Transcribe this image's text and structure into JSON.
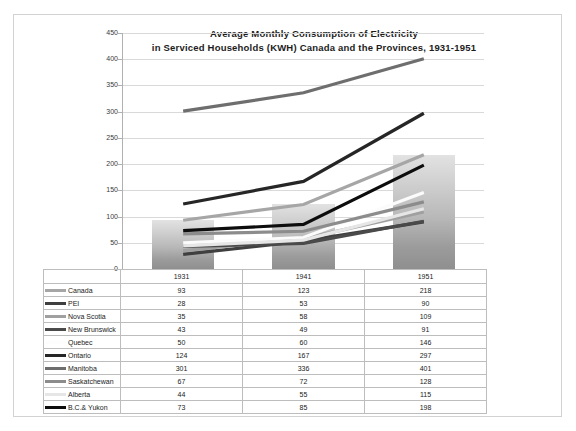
{
  "chart_data": {
    "type": "line",
    "title": "Average Monthly Consumption  of Electricity",
    "subtitle": "in Serviced Households  (KWH) Canada  and the Provinces, 1931-1951",
    "xlabel": "",
    "ylabel": "",
    "categories": [
      "1931",
      "1941",
      "1951"
    ],
    "ylim": [
      0,
      450
    ],
    "ytick_step": 50,
    "yticks": [
      "450",
      "400",
      "350",
      "300",
      "250",
      "200",
      "150",
      "100",
      "50",
      "0"
    ],
    "grid": true,
    "legend": "table-left-column",
    "background_bars": {
      "name": "Canada",
      "values": [
        93,
        123,
        218
      ],
      "note": "grey gradient column bars behind the lines"
    },
    "series": [
      {
        "name": "Canada",
        "values": [
          93,
          123,
          218
        ],
        "color": "#a6a6a6"
      },
      {
        "name": "PEI",
        "values": [
          28,
          53,
          90
        ],
        "color": "#3f3f3f"
      },
      {
        "name": "Nova Scotia",
        "values": [
          35,
          58,
          109
        ],
        "color": "#a0a0a0"
      },
      {
        "name": "New Brunswick",
        "values": [
          43,
          49,
          91
        ],
        "color": "#4a4a4a"
      },
      {
        "name": "Quebec",
        "values": [
          50,
          60,
          146
        ],
        "color": "#fbfbfb"
      },
      {
        "name": "Ontario",
        "values": [
          124,
          167,
          297
        ],
        "color": "#262626"
      },
      {
        "name": "Manitoba",
        "values": [
          301,
          336,
          401
        ],
        "color": "#6e6e6e"
      },
      {
        "name": "Saskatchewan",
        "values": [
          67,
          72,
          128
        ],
        "color": "#8c8c8c"
      },
      {
        "name": "Alberta",
        "values": [
          44,
          55,
          115
        ],
        "color": "#e6e6e6"
      },
      {
        "name": "B.C.& Yukon",
        "values": [
          73,
          85,
          198
        ],
        "color": "#0d0d0d"
      }
    ]
  },
  "table": {
    "header": [
      "",
      "1931",
      "1941",
      "1951"
    ],
    "rows": [
      {
        "label": "Canada",
        "swatch": "#a6a6a6",
        "v1931": "93",
        "v1941": "123",
        "v1951": "218"
      },
      {
        "label": "PEI",
        "swatch": "#3f3f3f",
        "v1931": "28",
        "v1941": "53",
        "v1951": "90"
      },
      {
        "label": "Nova Scotia",
        "swatch": "#a0a0a0",
        "v1931": "35",
        "v1941": "58",
        "v1951": "109"
      },
      {
        "label": "New Brunswick",
        "swatch": "#4a4a4a",
        "v1931": "43",
        "v1941": "49",
        "v1951": "91"
      },
      {
        "label": "Quebec",
        "swatch": "#fdfdfd",
        "v1931": "50",
        "v1941": "60",
        "v1951": "146"
      },
      {
        "label": "Ontario",
        "swatch": "#262626",
        "v1931": "124",
        "v1941": "167",
        "v1951": "297"
      },
      {
        "label": "Manitoba",
        "swatch": "#6e6e6e",
        "v1931": "301",
        "v1941": "336",
        "v1951": "401"
      },
      {
        "label": "Saskatchewan",
        "swatch": "#8c8c8c",
        "v1931": "67",
        "v1941": "72",
        "v1951": "128"
      },
      {
        "label": "Alberta",
        "swatch": "#e6e6e6",
        "v1931": "44",
        "v1941": "55",
        "v1951": "115"
      },
      {
        "label": "B.C.& Yukon",
        "swatch": "#0d0d0d",
        "v1931": "73",
        "v1941": "85",
        "v1951": "198"
      }
    ]
  }
}
